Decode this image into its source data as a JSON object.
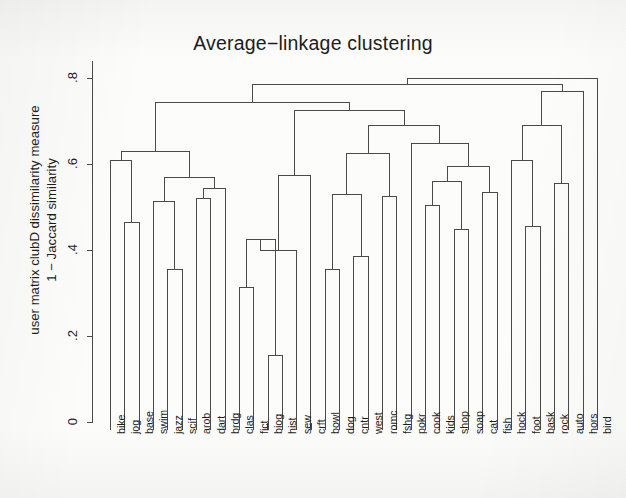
{
  "plot": {
    "title": "Average−linkage clustering",
    "background_color": "#fcfcfb",
    "line_color": "#4a4a4a"
  },
  "axes": {
    "y_title_line1": "user matrix clubD dissimilarity measure",
    "y_title_line2": "1 − Jaccard similarity",
    "y_ticks": [
      "0",
      ".2",
      ".4",
      ".6",
      ".8"
    ],
    "y_tick_values": [
      0,
      0.2,
      0.4,
      0.6,
      0.8
    ],
    "y_min": 0,
    "y_max": 0.84,
    "x_title": ""
  },
  "chart_data": {
    "type": "dendrogram",
    "title": "Average−linkage clustering",
    "xlabel": "",
    "ylabel": "user matrix clubD dissimilarity measure / 1 − Jaccard similarity",
    "ylim": [
      0,
      0.84
    ],
    "grid": false,
    "legend": "none",
    "linkage": "average",
    "distance_metric": "1 - Jaccard similarity",
    "leaves": [
      "bike",
      "jog",
      "base",
      "swim",
      "jazz",
      "scif",
      "arob",
      "dart",
      "brdg",
      "clas",
      "fict",
      "biog",
      "hist",
      "sew",
      "crft",
      "bowl",
      "dog",
      "cntr",
      "west",
      "romc",
      "fshg",
      "pokr",
      "cook",
      "kids",
      "shop",
      "soap",
      "cat",
      "fish",
      "hock",
      "foot",
      "bask",
      "rock",
      "auto",
      "hors",
      "bird"
    ],
    "n_leaves": 35,
    "merges": [
      {
        "id": "m1",
        "left": "jog",
        "right": "base",
        "height": 0.465
      },
      {
        "id": "m2",
        "left": "bike",
        "right": "m1",
        "height": 0.61
      },
      {
        "id": "m3",
        "left": "jazz",
        "right": "scif",
        "height": 0.355
      },
      {
        "id": "m4",
        "left": "swim",
        "right": "m3",
        "height": 0.515
      },
      {
        "id": "m5",
        "left": "arob",
        "right": "dart",
        "height": 0.52
      },
      {
        "id": "m6",
        "left": "m5",
        "right": "brdg",
        "height": 0.545
      },
      {
        "id": "m7",
        "left": "m4",
        "right": "m6",
        "height": 0.57
      },
      {
        "id": "m8",
        "left": "m2",
        "right": "m7",
        "height": 0.63
      },
      {
        "id": "m9",
        "left": "clas",
        "right": "fict",
        "height": 0.315
      },
      {
        "id": "m10",
        "left": "biog",
        "right": "hist",
        "height": 0.155
      },
      {
        "id": "m11",
        "left": "m9",
        "right": "m10",
        "height": 0.425
      },
      {
        "id": "m12",
        "left": "m11",
        "right": "sew",
        "height": 0.4
      },
      {
        "id": "m13",
        "left": "m12",
        "right": "crft",
        "height": 0.575
      },
      {
        "id": "m14",
        "left": "bowl",
        "right": "dog",
        "height": 0.355
      },
      {
        "id": "m15",
        "left": "cntr",
        "right": "west",
        "height": 0.385
      },
      {
        "id": "m16",
        "left": "m14",
        "right": "m15",
        "height": 0.53
      },
      {
        "id": "m17",
        "left": "romc",
        "right": "fshg",
        "height": 0.525
      },
      {
        "id": "m18",
        "left": "m16",
        "right": "m17",
        "height": 0.625
      },
      {
        "id": "m19",
        "left": "cook",
        "right": "kids",
        "height": 0.505
      },
      {
        "id": "m20",
        "left": "shop",
        "right": "soap",
        "height": 0.45
      },
      {
        "id": "m21",
        "left": "m19",
        "right": "m20",
        "height": 0.56
      },
      {
        "id": "m22",
        "left": "cat",
        "right": "fish",
        "height": 0.535
      },
      {
        "id": "m23",
        "left": "m21",
        "right": "m22",
        "height": 0.595
      },
      {
        "id": "m24",
        "left": "pokr",
        "right": "m23",
        "height": 0.65
      },
      {
        "id": "m25",
        "left": "m18",
        "right": "m24",
        "height": 0.69
      },
      {
        "id": "m26",
        "left": "foot",
        "right": "bask",
        "height": 0.455
      },
      {
        "id": "m27",
        "left": "hock",
        "right": "m26",
        "height": 0.61
      },
      {
        "id": "m28",
        "left": "rock",
        "right": "auto",
        "height": 0.555
      },
      {
        "id": "m29",
        "left": "m27",
        "right": "m28",
        "height": 0.69
      },
      {
        "id": "m30",
        "left": "m13",
        "right": "m25",
        "height": 0.725
      },
      {
        "id": "m31",
        "left": "m8",
        "right": "m30",
        "height": 0.745
      },
      {
        "id": "m32",
        "left": "m29",
        "right": "hors",
        "height": 0.77
      },
      {
        "id": "m33",
        "left": "m31",
        "right": "m32",
        "height": 0.785
      },
      {
        "id": "m34",
        "left": "m33",
        "right": "bird",
        "height": 0.8
      }
    ]
  }
}
